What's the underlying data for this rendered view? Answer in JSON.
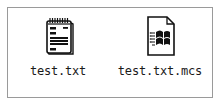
{
  "files": [
    {
      "name": "test.txt",
      "icon": "notepad-text-file-icon"
    },
    {
      "name": "test.txt.mcs",
      "icon": "windows-document-icon"
    }
  ],
  "colors": {
    "border": "#9a9a9a",
    "icon_stroke": "#111111",
    "text": "#1a1a1a"
  }
}
